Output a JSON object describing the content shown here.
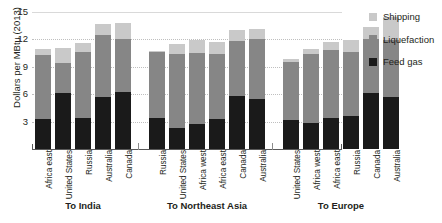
{
  "chart_data": {
    "type": "bar",
    "subtype": "stacked-bar-grouped",
    "title": "",
    "xlabel": "",
    "ylabel": "Dollars per MBtu (2013)",
    "ylim": [
      0,
      15
    ],
    "yticks": [
      3,
      6,
      9,
      12,
      15
    ],
    "grid": "horizontal",
    "legend_position": "right",
    "series": [
      {
        "name": "Feed gas",
        "color": "#1a1a1a"
      },
      {
        "name": "Liquefaction",
        "color": "#868686"
      },
      {
        "name": "Shipping",
        "color": "#c9c9c9"
      }
    ],
    "groups": [
      {
        "label": "To India",
        "categories": [
          "Africa east",
          "United States",
          "Russia",
          "Australia",
          "Canada"
        ],
        "feed_gas": [
          3.3,
          6.1,
          3.4,
          5.7,
          6.2
        ],
        "liquefaction": [
          7.0,
          3.3,
          7.2,
          6.8,
          5.9
        ],
        "shipping": [
          0.7,
          1.7,
          1.0,
          1.2,
          1.7
        ],
        "totals": [
          11.0,
          11.1,
          11.6,
          13.7,
          13.8
        ]
      },
      {
        "label": "To Northeast Asia",
        "categories": [
          "Russia",
          "United States",
          "Africa west",
          "Africa east",
          "Canada",
          "Australia"
        ],
        "feed_gas": [
          3.4,
          2.3,
          2.7,
          3.3,
          5.8,
          5.5
        ],
        "liquefaction": [
          7.2,
          8.1,
          7.8,
          7.1,
          6.0,
          6.5
        ],
        "shipping": [
          0.1,
          1.1,
          1.4,
          1.3,
          1.2,
          1.1
        ],
        "totals": [
          10.7,
          11.5,
          11.9,
          11.7,
          13.0,
          13.1
        ]
      },
      {
        "label": "To Europe",
        "categories": [
          "United States",
          "Africa west",
          "Africa east",
          "Russia",
          "Canada",
          "Australia"
        ],
        "feed_gas": [
          3.2,
          2.8,
          3.4,
          3.6,
          6.1,
          5.7
        ],
        "liquefaction": [
          6.3,
          7.6,
          7.4,
          7.0,
          5.9,
          6.2
        ],
        "shipping": [
          0.4,
          0.6,
          0.9,
          1.3,
          1.4,
          2.6
        ],
        "totals": [
          9.9,
          11.0,
          11.7,
          11.9,
          13.4,
          14.5
        ]
      }
    ]
  },
  "legend": {
    "items": [
      {
        "label": "Shipping",
        "color": "#c9c9c9"
      },
      {
        "label": "Liquefaction",
        "color": "#868686"
      },
      {
        "label": "Feed gas",
        "color": "#1a1a1a"
      }
    ]
  }
}
